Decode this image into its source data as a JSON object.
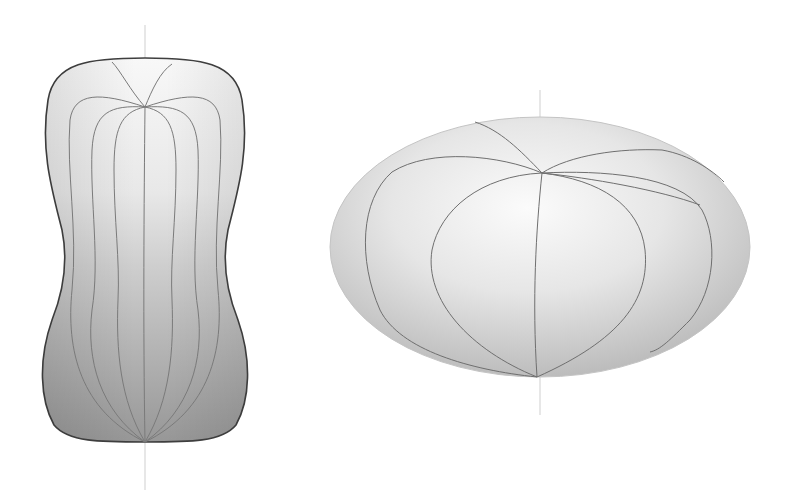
{
  "figure": {
    "width": 787,
    "height": 498,
    "background": "#ffffff",
    "shapes": [
      {
        "id": "peanut",
        "name": "peanut-shaped-body",
        "axis": {
          "x": 145,
          "y1": 25,
          "y2": 490,
          "color": "#c8c8c8"
        },
        "outline_color": "#444444",
        "meridian_color": "#777777",
        "gradient": {
          "top": "#f6f6f6",
          "mid": "#d4d4d4",
          "bottom": "#9a9a9a"
        },
        "top_pole": [
          145,
          107
        ],
        "bottom_pole": [
          145,
          442
        ]
      },
      {
        "id": "ellipsoid",
        "name": "oblate-ellipsoid-body",
        "axis": {
          "x": 540,
          "y1": 90,
          "y2": 415,
          "color": "#c8c8c8"
        },
        "center": [
          540,
          247
        ],
        "rx": 210,
        "ry": 130,
        "outline_color": "#b5b5b5",
        "meridian_color": "#6e6e6e",
        "gradient": {
          "highlight": "#fafafa",
          "edge": "#bdbdbd"
        },
        "top_pole": [
          542,
          173
        ],
        "bottom_pole": [
          537,
          377
        ]
      }
    ]
  }
}
